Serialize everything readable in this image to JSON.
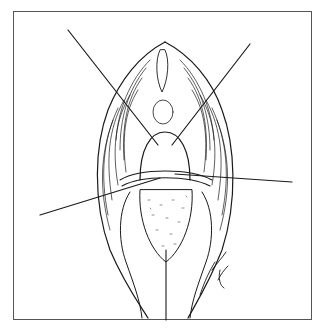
{
  "figure": {
    "kind": "surgical line illustration",
    "style": "black ink line drawing",
    "frame_color": "#555555",
    "ink_color": "#1a1a1a",
    "background": "#ffffff",
    "elements": [
      "bordered frame",
      "central oval anatomical field with hatched tissue folds",
      "four traction suture lines radiating to upper-left, upper-right, left and right",
      "horizontal incision band across middle",
      "stippled exposed tissue region",
      "central vertical suture line at bottom",
      "artist signature lower right"
    ],
    "signature": "illegible artist signature"
  }
}
